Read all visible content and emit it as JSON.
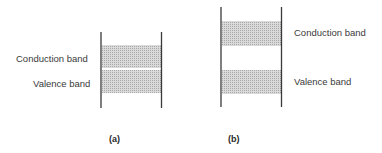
{
  "diagram": {
    "type": "energy-band-diagram",
    "colors": {
      "line": "#3a3a3a",
      "band_fill": "#d4d4d4",
      "band_dots": "#a8a8a8"
    },
    "panels": [
      {
        "id": "a",
        "caption": "(a)",
        "bands": [
          {
            "label": "Conduction band"
          },
          {
            "label": "Valence band"
          }
        ],
        "gap": "none (bands adjacent/overlapping)"
      },
      {
        "id": "b",
        "caption": "(b)",
        "bands": [
          {
            "label": "Conduction band"
          },
          {
            "label": "Valence band"
          }
        ],
        "gap": "wide energy gap"
      }
    ]
  }
}
